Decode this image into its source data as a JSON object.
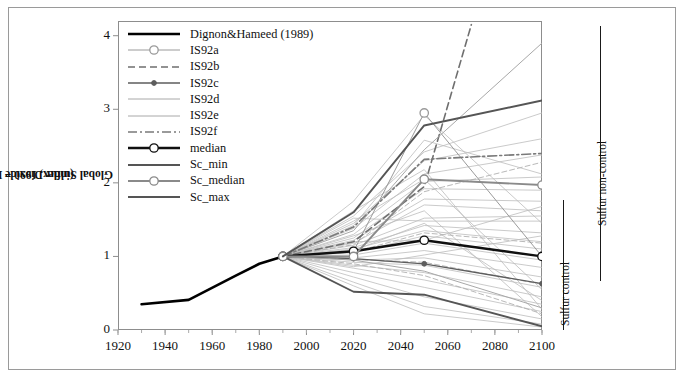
{
  "figure": {
    "axes": {
      "ylabel_line1": "Global Sulfur Dioxide Emissions",
      "ylabel_line2": "(index, 1990 = 1)",
      "yticks": [
        "0",
        "1",
        "2",
        "3",
        "4"
      ],
      "xticks": [
        "1920",
        "1940",
        "1960",
        "1980",
        "2000",
        "2020",
        "2040",
        "2060",
        "2080",
        "2100"
      ]
    },
    "annotations": [
      {
        "name": "sulfur-control",
        "text": "Sulfur control"
      },
      {
        "name": "sulfur-non-control",
        "text": "Sulfur non-control"
      }
    ]
  },
  "legend": {
    "items": [
      {
        "label": "Dignon&Hameed (1989)",
        "key": "thick-black-solid"
      },
      {
        "label": "IS92a",
        "key": "gray-thin-open-circle"
      },
      {
        "label": "IS92b",
        "key": "gray-dashed"
      },
      {
        "label": "IS92c",
        "key": "gray-filled-dot"
      },
      {
        "label": "IS92d",
        "key": "gray-thin-solid"
      },
      {
        "label": "IS92e",
        "key": "gray-thin-solid"
      },
      {
        "label": "IS92f",
        "key": "gray-dash-dot"
      },
      {
        "label": "median",
        "key": "thick-black-open-circle"
      },
      {
        "label": "Sc_min",
        "key": "gray-medium-solid"
      },
      {
        "label": "Sc_median",
        "key": "gray-medium-open-circle"
      },
      {
        "label": "Sc_max",
        "key": "gray-medium-solid"
      }
    ]
  },
  "chart_data": {
    "type": "line",
    "title": "",
    "xlabel": "",
    "ylabel": "Global Sulfur Dioxide Emissions (index, 1990 = 1)",
    "xlim": [
      1920,
      2100
    ],
    "ylim": [
      0,
      4.2
    ],
    "grid": false,
    "legend_position": "top-left-inside",
    "colors": {
      "historical": "#000000",
      "median": "#101010",
      "is92a": "#9a9a9a",
      "is92b": "#6f6f6f",
      "is92c": "#5d5d5d",
      "is92d": "#a8a8a8",
      "is92e": "#a8a8a8",
      "is92f": "#7a7a7a",
      "sc_min": "#555555",
      "sc_median": "#8a8a8a",
      "sc_max": "#555555",
      "ensemble": "#bdbdbd"
    },
    "series": [
      {
        "name": "Dignon&Hameed (1989)",
        "style": "thick-black-solid",
        "markers": false,
        "x": [
          1930,
          1950,
          1970,
          1980,
          1990
        ],
        "values": [
          0.35,
          0.41,
          0.74,
          0.9,
          1.0
        ]
      },
      {
        "name": "IS92a",
        "style": "gray-thin-open-circle",
        "markers": true,
        "x": [
          1990,
          2020,
          2050,
          2100
        ],
        "values": [
          1.0,
          1.07,
          2.95,
          1.0
        ]
      },
      {
        "name": "IS92b",
        "style": "gray-dashed",
        "markers": false,
        "x": [
          1990,
          2020,
          2050,
          2070
        ],
        "values": [
          1.0,
          1.2,
          1.95,
          4.15
        ]
      },
      {
        "name": "IS92c",
        "style": "gray-filled-dot",
        "markers": true,
        "x": [
          1990,
          2020,
          2050,
          2100
        ],
        "values": [
          1.0,
          0.97,
          0.9,
          0.63
        ]
      },
      {
        "name": "IS92d",
        "style": "gray-thin-solid",
        "markers": false,
        "x": [
          1990,
          2020,
          2050,
          2100
        ],
        "values": [
          1.0,
          0.95,
          0.8,
          0.3
        ]
      },
      {
        "name": "IS92e",
        "style": "gray-thin-solid",
        "markers": false,
        "x": [
          1990,
          2020,
          2050,
          2100
        ],
        "values": [
          1.0,
          1.35,
          2.45,
          3.9
        ]
      },
      {
        "name": "IS92f",
        "style": "gray-dash-dot",
        "markers": false,
        "x": [
          1990,
          2020,
          2050,
          2100
        ],
        "values": [
          1.0,
          1.4,
          2.32,
          2.4
        ]
      },
      {
        "name": "median",
        "style": "thick-black-open-circle",
        "markers": true,
        "x": [
          1990,
          2020,
          2050,
          2100
        ],
        "values": [
          1.0,
          1.07,
          1.22,
          1.0
        ]
      },
      {
        "name": "Sc_min",
        "style": "gray-medium-solid",
        "markers": false,
        "x": [
          1990,
          2020,
          2050,
          2100
        ],
        "values": [
          1.0,
          0.52,
          0.48,
          0.05
        ]
      },
      {
        "name": "Sc_median",
        "style": "gray-medium-open-circle",
        "markers": true,
        "x": [
          1990,
          2020,
          2050,
          2100
        ],
        "values": [
          1.0,
          1.0,
          2.05,
          1.97
        ]
      },
      {
        "name": "Sc_max",
        "style": "gray-medium-solid",
        "markers": false,
        "x": [
          1990,
          2020,
          2050,
          2100
        ],
        "values": [
          1.0,
          1.6,
          2.78,
          3.12
        ]
      },
      {
        "name": "ensemble-01",
        "style": "ensemble",
        "markers": false,
        "x": [
          1990,
          2020,
          2050,
          2100
        ],
        "values": [
          1.0,
          1.75,
          2.92,
          1.45
        ]
      },
      {
        "name": "ensemble-02",
        "style": "ensemble",
        "markers": false,
        "x": [
          1990,
          2020,
          2050,
          2100
        ],
        "values": [
          1.0,
          1.55,
          2.42,
          2.95
        ]
      },
      {
        "name": "ensemble-03",
        "style": "ensemble",
        "markers": false,
        "x": [
          1990,
          2020,
          2050,
          2100
        ],
        "values": [
          1.0,
          1.45,
          2.3,
          2.6
        ]
      },
      {
        "name": "ensemble-04",
        "style": "ensemble",
        "markers": false,
        "x": [
          1990,
          2020,
          2050,
          2100
        ],
        "values": [
          1.0,
          1.38,
          2.12,
          2.38
        ]
      },
      {
        "name": "ensemble-05",
        "style": "ensemble",
        "markers": false,
        "x": [
          1990,
          2020,
          2050,
          2100
        ],
        "values": [
          1.0,
          1.3,
          2.02,
          2.08
        ]
      },
      {
        "name": "ensemble-06",
        "style": "ensemble",
        "markers": false,
        "x": [
          1990,
          2020,
          2050,
          2100
        ],
        "values": [
          1.0,
          1.25,
          1.92,
          1.9
        ]
      },
      {
        "name": "ensemble-07",
        "style": "ensemble",
        "markers": false,
        "x": [
          1990,
          2020,
          2050,
          2100
        ],
        "values": [
          1.0,
          1.22,
          1.78,
          1.75
        ]
      },
      {
        "name": "ensemble-08",
        "style": "ensemble",
        "markers": false,
        "x": [
          1990,
          2020,
          2050,
          2100
        ],
        "values": [
          1.0,
          1.18,
          1.7,
          1.62
        ]
      },
      {
        "name": "ensemble-09",
        "style": "ensemble",
        "markers": false,
        "x": [
          1990,
          2020,
          2050,
          2100
        ],
        "values": [
          1.0,
          1.15,
          1.52,
          1.55
        ]
      },
      {
        "name": "ensemble-10",
        "style": "ensemble",
        "markers": false,
        "x": [
          1990,
          2020,
          2050,
          2100
        ],
        "values": [
          1.0,
          1.12,
          1.42,
          1.32
        ]
      },
      {
        "name": "ensemble-11",
        "style": "ensemble",
        "markers": false,
        "x": [
          1990,
          2020,
          2050,
          2100
        ],
        "values": [
          1.0,
          1.1,
          1.35,
          1.2
        ]
      },
      {
        "name": "ensemble-12",
        "style": "ensemble",
        "markers": false,
        "x": [
          1990,
          2020,
          2050,
          2100
        ],
        "values": [
          1.0,
          1.05,
          1.28,
          1.1
        ]
      },
      {
        "name": "ensemble-13",
        "style": "ensemble",
        "markers": false,
        "x": [
          1990,
          2020,
          2050,
          2100
        ],
        "values": [
          1.0,
          1.02,
          1.18,
          0.95
        ]
      },
      {
        "name": "ensemble-14",
        "style": "ensemble",
        "markers": false,
        "x": [
          1990,
          2020,
          2050,
          2100
        ],
        "values": [
          1.0,
          0.98,
          1.08,
          0.85
        ]
      },
      {
        "name": "ensemble-15",
        "style": "ensemble",
        "markers": false,
        "x": [
          1990,
          2020,
          2050,
          2100
        ],
        "values": [
          1.0,
          0.95,
          0.98,
          0.72
        ]
      },
      {
        "name": "ensemble-16",
        "style": "ensemble",
        "markers": false,
        "x": [
          1990,
          2020,
          2050,
          2100
        ],
        "values": [
          1.0,
          0.92,
          0.88,
          0.58
        ]
      },
      {
        "name": "ensemble-17",
        "style": "ensemble",
        "markers": false,
        "x": [
          1990,
          2020,
          2050,
          2100
        ],
        "values": [
          1.0,
          0.88,
          0.78,
          0.45
        ]
      },
      {
        "name": "ensemble-18",
        "style": "ensemble",
        "markers": false,
        "x": [
          1990,
          2020,
          2050,
          2100
        ],
        "values": [
          1.0,
          0.84,
          0.68,
          0.35
        ]
      },
      {
        "name": "ensemble-19",
        "style": "ensemble",
        "markers": false,
        "x": [
          1990,
          2020,
          2050,
          2100
        ],
        "values": [
          1.0,
          0.78,
          0.58,
          0.25
        ]
      },
      {
        "name": "ensemble-20",
        "style": "ensemble",
        "markers": false,
        "x": [
          1990,
          2020,
          2050,
          2100
        ],
        "values": [
          1.0,
          0.72,
          0.45,
          0.15
        ]
      },
      {
        "name": "ensemble-21",
        "style": "ensemble",
        "markers": false,
        "x": [
          1990,
          2020,
          2050,
          2100
        ],
        "values": [
          1.0,
          0.65,
          0.32,
          0.08
        ]
      },
      {
        "name": "ensemble-22",
        "style": "ensemble",
        "markers": false,
        "x": [
          1990,
          2020,
          2050,
          2100
        ],
        "values": [
          1.0,
          0.6,
          0.22,
          0.04
        ]
      },
      {
        "name": "ensemble-23",
        "style": "ensemble",
        "markers": false,
        "x": [
          1990,
          2020,
          2050,
          2100
        ],
        "values": [
          1.0,
          1.62,
          2.18,
          0.28
        ]
      },
      {
        "name": "ensemble-24",
        "style": "ensemble",
        "markers": false,
        "x": [
          1990,
          2020,
          2050,
          2100
        ],
        "values": [
          1.0,
          1.48,
          2.05,
          0.55
        ]
      },
      {
        "name": "ensemble-25",
        "style": "ensemble",
        "markers": false,
        "x": [
          1990,
          2020,
          2050,
          2100
        ],
        "values": [
          1.0,
          1.28,
          1.62,
          0.18
        ]
      },
      {
        "name": "ensemble-26",
        "style": "ensemble",
        "markers": false,
        "x": [
          1990,
          2020,
          2050,
          2100
        ],
        "values": [
          1.0,
          1.08,
          1.45,
          0.4
        ]
      },
      {
        "name": "ensemble-27",
        "style": "ensemble-dash",
        "markers": false,
        "x": [
          1990,
          2020,
          2050,
          2100
        ],
        "values": [
          1.0,
          1.16,
          1.88,
          2.28
        ]
      },
      {
        "name": "ensemble-28",
        "style": "ensemble-dash",
        "markers": false,
        "x": [
          1990,
          2020,
          2050,
          2100
        ],
        "values": [
          1.0,
          1.06,
          1.32,
          1.18
        ]
      },
      {
        "name": "ensemble-29",
        "style": "ensemble-dash",
        "markers": false,
        "x": [
          1990,
          2020,
          2050,
          2100
        ],
        "values": [
          1.0,
          0.96,
          0.92,
          0.62
        ]
      },
      {
        "name": "ensemble-30",
        "style": "ensemble-dash",
        "markers": false,
        "x": [
          1990,
          2020,
          2050,
          2100
        ],
        "values": [
          1.0,
          0.9,
          0.74,
          0.22
        ]
      },
      {
        "name": "ensemble-31",
        "style": "ensemble",
        "markers": false,
        "x": [
          1990,
          2020,
          2050,
          2100
        ],
        "values": [
          1.0,
          1.42,
          2.58,
          2.12
        ]
      },
      {
        "name": "ensemble-32",
        "style": "ensemble",
        "markers": false,
        "x": [
          1990,
          2020,
          2050,
          2100
        ],
        "values": [
          1.0,
          1.52,
          1.48,
          1.48
        ]
      },
      {
        "name": "ensemble-33",
        "style": "ensemble",
        "markers": false,
        "x": [
          1990,
          2020,
          2050,
          2100
        ],
        "values": [
          1.0,
          1.2,
          1.22,
          1.68
        ]
      },
      {
        "name": "ensemble-34",
        "style": "ensemble",
        "markers": false,
        "x": [
          1990,
          2020,
          2050,
          2100
        ],
        "values": [
          1.0,
          0.86,
          1.02,
          1.28
        ]
      }
    ]
  }
}
